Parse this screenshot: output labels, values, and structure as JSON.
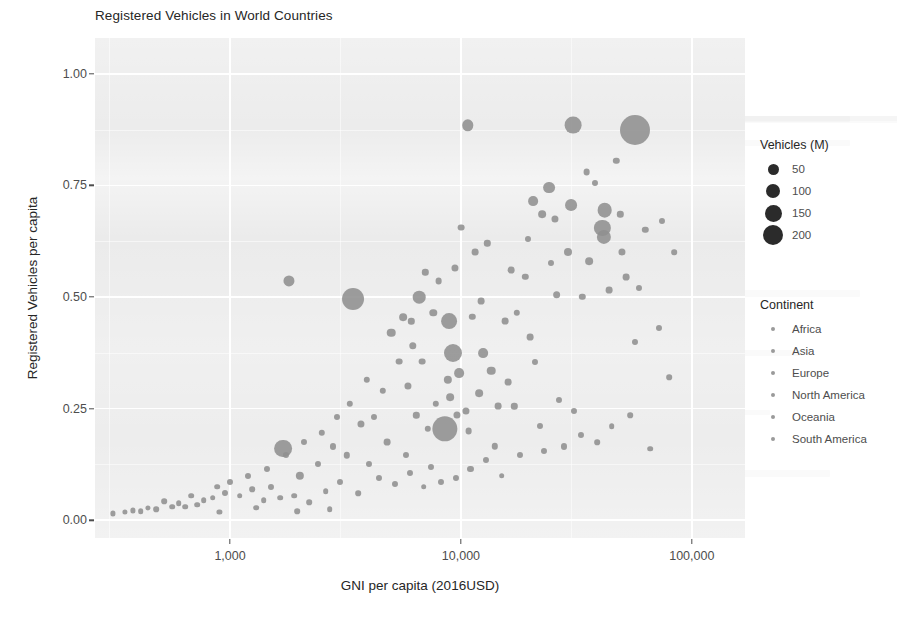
{
  "chart": {
    "title": "Registered Vehicles in World Countries",
    "xlabel": "GNI per capita (2016USD)",
    "ylabel": "Registered Vehicles per capita"
  },
  "axes": {
    "y_ticks": [
      "0.00",
      "0.25",
      "0.50",
      "0.75",
      "1.00"
    ],
    "x_ticks": [
      "1,000",
      "10,000",
      "100,000"
    ]
  },
  "legend_size": {
    "title": "Vehicles (M)",
    "items": [
      {
        "label": "50",
        "px": 11
      },
      {
        "label": "100",
        "px": 14
      },
      {
        "label": "150",
        "px": 17
      },
      {
        "label": "200",
        "px": 20
      }
    ]
  },
  "legend_continent": {
    "title": "Continent",
    "items": [
      {
        "label": "Africa"
      },
      {
        "label": "Asia"
      },
      {
        "label": "Europe"
      },
      {
        "label": "North America"
      },
      {
        "label": "Oceania"
      },
      {
        "label": "South America"
      }
    ]
  },
  "colors": {
    "panel": "#ebebeb",
    "grid": "#ffffff",
    "point": "#8f8f8f",
    "text": "#4d4d4d",
    "title": "#262626"
  },
  "chart_data": {
    "type": "scatter",
    "title": "Registered Vehicles in World Countries",
    "xlabel": "GNI per capita (2016USD)",
    "ylabel": "Registered Vehicles per capita",
    "xscale": "log",
    "xlim": [
      260,
      170000
    ],
    "ylim": [
      -0.04,
      1.08
    ],
    "grid": true,
    "xticks": [
      1000,
      10000,
      100000
    ],
    "xticklabels": [
      "1,000",
      "10,000",
      "100,000"
    ],
    "yticks": [
      0.0,
      0.25,
      0.5,
      0.75,
      1.0
    ],
    "yticklabels": [
      "0.00",
      "0.25",
      "0.50",
      "0.75",
      "1.00"
    ],
    "size_legend": {
      "title": "Vehicles (M)",
      "values": [
        50,
        100,
        150,
        200
      ]
    },
    "color_legend": {
      "title": "Continent",
      "values": [
        "Africa",
        "Asia",
        "Europe",
        "North America",
        "Oceania",
        "South America"
      ]
    },
    "legend_position": "right",
    "point_color": "#8f8f8f",
    "encoding": {
      "x": "GNI per capita (2016USD)",
      "y": "Registered Vehicles per capita",
      "size": "Vehicles (M)",
      "color": "Continent"
    },
    "points": [
      {
        "x": 57000,
        "y": 0.875,
        "s": 205
      },
      {
        "x": 30500,
        "y": 0.885,
        "s": 62
      },
      {
        "x": 10700,
        "y": 0.885,
        "s": 28
      },
      {
        "x": 42000,
        "y": 0.695,
        "s": 47
      },
      {
        "x": 41000,
        "y": 0.655,
        "s": 58
      },
      {
        "x": 41500,
        "y": 0.635,
        "s": 44
      },
      {
        "x": 24000,
        "y": 0.745,
        "s": 30
      },
      {
        "x": 30000,
        "y": 0.705,
        "s": 30
      },
      {
        "x": 20500,
        "y": 0.715,
        "s": 20
      },
      {
        "x": 22500,
        "y": 0.685,
        "s": 12
      },
      {
        "x": 25500,
        "y": 0.675,
        "s": 10
      },
      {
        "x": 47000,
        "y": 0.805,
        "s": 8
      },
      {
        "x": 35000,
        "y": 0.78,
        "s": 9
      },
      {
        "x": 29000,
        "y": 0.6,
        "s": 13
      },
      {
        "x": 36000,
        "y": 0.58,
        "s": 12
      },
      {
        "x": 50000,
        "y": 0.6,
        "s": 10
      },
      {
        "x": 52000,
        "y": 0.545,
        "s": 9
      },
      {
        "x": 26000,
        "y": 0.505,
        "s": 12
      },
      {
        "x": 44000,
        "y": 0.515,
        "s": 9
      },
      {
        "x": 59000,
        "y": 0.52,
        "s": 7
      },
      {
        "x": 3400,
        "y": 0.495,
        "s": 108
      },
      {
        "x": 8900,
        "y": 0.445,
        "s": 55
      },
      {
        "x": 1800,
        "y": 0.535,
        "s": 26
      },
      {
        "x": 9200,
        "y": 0.375,
        "s": 72
      },
      {
        "x": 9800,
        "y": 0.33,
        "s": 20
      },
      {
        "x": 8500,
        "y": 0.205,
        "s": 145
      },
      {
        "x": 1700,
        "y": 0.16,
        "s": 70
      },
      {
        "x": 2000,
        "y": 0.1,
        "s": 14
      },
      {
        "x": 6600,
        "y": 0.5,
        "s": 34
      },
      {
        "x": 5600,
        "y": 0.455,
        "s": 12
      },
      {
        "x": 5000,
        "y": 0.42,
        "s": 15
      },
      {
        "x": 6200,
        "y": 0.39,
        "s": 11
      },
      {
        "x": 6800,
        "y": 0.355,
        "s": 9
      },
      {
        "x": 5900,
        "y": 0.3,
        "s": 10
      },
      {
        "x": 7600,
        "y": 0.465,
        "s": 11
      },
      {
        "x": 12500,
        "y": 0.375,
        "s": 20
      },
      {
        "x": 13500,
        "y": 0.335,
        "s": 15
      },
      {
        "x": 12000,
        "y": 0.285,
        "s": 12
      },
      {
        "x": 16000,
        "y": 0.31,
        "s": 9
      },
      {
        "x": 14500,
        "y": 0.255,
        "s": 9
      },
      {
        "x": 17000,
        "y": 0.255,
        "s": 8
      },
      {
        "x": 20000,
        "y": 0.41,
        "s": 9
      },
      {
        "x": 21000,
        "y": 0.355,
        "s": 7
      },
      {
        "x": 10500,
        "y": 0.245,
        "s": 10
      },
      {
        "x": 9000,
        "y": 0.275,
        "s": 12
      },
      {
        "x": 7800,
        "y": 0.26,
        "s": 8
      },
      {
        "x": 4200,
        "y": 0.23,
        "s": 7
      },
      {
        "x": 3700,
        "y": 0.215,
        "s": 10
      },
      {
        "x": 4800,
        "y": 0.175,
        "s": 9
      },
      {
        "x": 3200,
        "y": 0.145,
        "s": 8
      },
      {
        "x": 2800,
        "y": 0.165,
        "s": 7
      },
      {
        "x": 2400,
        "y": 0.125,
        "s": 7
      },
      {
        "x": 1500,
        "y": 0.075,
        "s": 7
      },
      {
        "x": 1250,
        "y": 0.07,
        "s": 6
      },
      {
        "x": 1100,
        "y": 0.055,
        "s": 6
      },
      {
        "x": 950,
        "y": 0.06,
        "s": 7
      },
      {
        "x": 840,
        "y": 0.05,
        "s": 6
      },
      {
        "x": 720,
        "y": 0.035,
        "s": 6
      },
      {
        "x": 640,
        "y": 0.03,
        "s": 6
      },
      {
        "x": 560,
        "y": 0.03,
        "s": 6
      },
      {
        "x": 480,
        "y": 0.025,
        "s": 6
      },
      {
        "x": 410,
        "y": 0.02,
        "s": 6
      },
      {
        "x": 350,
        "y": 0.018,
        "s": 5
      },
      {
        "x": 310,
        "y": 0.015,
        "s": 5
      },
      {
        "x": 1400,
        "y": 0.045,
        "s": 6
      },
      {
        "x": 1650,
        "y": 0.05,
        "s": 6
      },
      {
        "x": 1900,
        "y": 0.055,
        "s": 6
      },
      {
        "x": 2200,
        "y": 0.04,
        "s": 6
      },
      {
        "x": 2600,
        "y": 0.065,
        "s": 6
      },
      {
        "x": 3000,
        "y": 0.085,
        "s": 7
      },
      {
        "x": 3600,
        "y": 0.06,
        "s": 6
      },
      {
        "x": 4400,
        "y": 0.095,
        "s": 7
      },
      {
        "x": 5200,
        "y": 0.08,
        "s": 7
      },
      {
        "x": 6000,
        "y": 0.105,
        "s": 7
      },
      {
        "x": 6900,
        "y": 0.075,
        "s": 6
      },
      {
        "x": 7400,
        "y": 0.12,
        "s": 7
      },
      {
        "x": 8200,
        "y": 0.085,
        "s": 7
      },
      {
        "x": 9500,
        "y": 0.095,
        "s": 7
      },
      {
        "x": 11000,
        "y": 0.115,
        "s": 7
      },
      {
        "x": 12800,
        "y": 0.135,
        "s": 7
      },
      {
        "x": 15000,
        "y": 0.1,
        "s": 6
      },
      {
        "x": 18000,
        "y": 0.145,
        "s": 7
      },
      {
        "x": 23000,
        "y": 0.155,
        "s": 7
      },
      {
        "x": 28000,
        "y": 0.165,
        "s": 7
      },
      {
        "x": 33000,
        "y": 0.19,
        "s": 7
      },
      {
        "x": 39000,
        "y": 0.175,
        "s": 6
      },
      {
        "x": 45000,
        "y": 0.21,
        "s": 6
      },
      {
        "x": 54000,
        "y": 0.235,
        "s": 6
      },
      {
        "x": 66000,
        "y": 0.16,
        "s": 6
      },
      {
        "x": 80000,
        "y": 0.32,
        "s": 6
      },
      {
        "x": 72000,
        "y": 0.43,
        "s": 7
      },
      {
        "x": 63000,
        "y": 0.65,
        "s": 8
      },
      {
        "x": 74000,
        "y": 0.67,
        "s": 7
      },
      {
        "x": 84000,
        "y": 0.6,
        "s": 6
      },
      {
        "x": 49000,
        "y": 0.685,
        "s": 8
      },
      {
        "x": 38000,
        "y": 0.755,
        "s": 7
      },
      {
        "x": 16500,
        "y": 0.56,
        "s": 9
      },
      {
        "x": 19000,
        "y": 0.545,
        "s": 8
      },
      {
        "x": 11500,
        "y": 0.6,
        "s": 9
      },
      {
        "x": 13000,
        "y": 0.62,
        "s": 8
      },
      {
        "x": 10000,
        "y": 0.655,
        "s": 9
      },
      {
        "x": 9400,
        "y": 0.565,
        "s": 10
      },
      {
        "x": 8000,
        "y": 0.535,
        "s": 9
      },
      {
        "x": 7000,
        "y": 0.555,
        "s": 8
      },
      {
        "x": 5400,
        "y": 0.355,
        "s": 9
      },
      {
        "x": 4600,
        "y": 0.29,
        "s": 8
      },
      {
        "x": 3900,
        "y": 0.315,
        "s": 8
      },
      {
        "x": 3300,
        "y": 0.26,
        "s": 8
      },
      {
        "x": 2900,
        "y": 0.23,
        "s": 7
      },
      {
        "x": 2500,
        "y": 0.195,
        "s": 8
      },
      {
        "x": 2100,
        "y": 0.175,
        "s": 7
      },
      {
        "x": 1750,
        "y": 0.145,
        "s": 7
      },
      {
        "x": 1450,
        "y": 0.115,
        "s": 7
      },
      {
        "x": 1200,
        "y": 0.1,
        "s": 7
      },
      {
        "x": 1000,
        "y": 0.085,
        "s": 7
      },
      {
        "x": 880,
        "y": 0.075,
        "s": 6
      },
      {
        "x": 770,
        "y": 0.045,
        "s": 6
      },
      {
        "x": 680,
        "y": 0.055,
        "s": 6
      },
      {
        "x": 600,
        "y": 0.038,
        "s": 6
      },
      {
        "x": 520,
        "y": 0.042,
        "s": 6
      },
      {
        "x": 440,
        "y": 0.028,
        "s": 5
      },
      {
        "x": 380,
        "y": 0.022,
        "s": 5
      },
      {
        "x": 8800,
        "y": 0.315,
        "s": 14
      },
      {
        "x": 9600,
        "y": 0.235,
        "s": 10
      },
      {
        "x": 10800,
        "y": 0.2,
        "s": 9
      },
      {
        "x": 7200,
        "y": 0.205,
        "s": 8
      },
      {
        "x": 6400,
        "y": 0.235,
        "s": 8
      },
      {
        "x": 5800,
        "y": 0.145,
        "s": 7
      },
      {
        "x": 4000,
        "y": 0.125,
        "s": 7
      },
      {
        "x": 14000,
        "y": 0.165,
        "s": 8
      },
      {
        "x": 22000,
        "y": 0.21,
        "s": 7
      },
      {
        "x": 26500,
        "y": 0.27,
        "s": 7
      },
      {
        "x": 31000,
        "y": 0.245,
        "s": 7
      },
      {
        "x": 57000,
        "y": 0.4,
        "s": 7
      },
      {
        "x": 15500,
        "y": 0.445,
        "s": 9
      },
      {
        "x": 17500,
        "y": 0.465,
        "s": 8
      },
      {
        "x": 19500,
        "y": 0.63,
        "s": 7
      },
      {
        "x": 24500,
        "y": 0.575,
        "s": 7
      },
      {
        "x": 12200,
        "y": 0.49,
        "s": 9
      },
      {
        "x": 11200,
        "y": 0.455,
        "s": 8
      },
      {
        "x": 6100,
        "y": 0.445,
        "s": 8
      },
      {
        "x": 2700,
        "y": 0.025,
        "s": 6
      },
      {
        "x": 1950,
        "y": 0.02,
        "s": 6
      },
      {
        "x": 1300,
        "y": 0.028,
        "s": 6
      },
      {
        "x": 900,
        "y": 0.018,
        "s": 5
      },
      {
        "x": 33500,
        "y": 0.5,
        "s": 8
      }
    ]
  }
}
